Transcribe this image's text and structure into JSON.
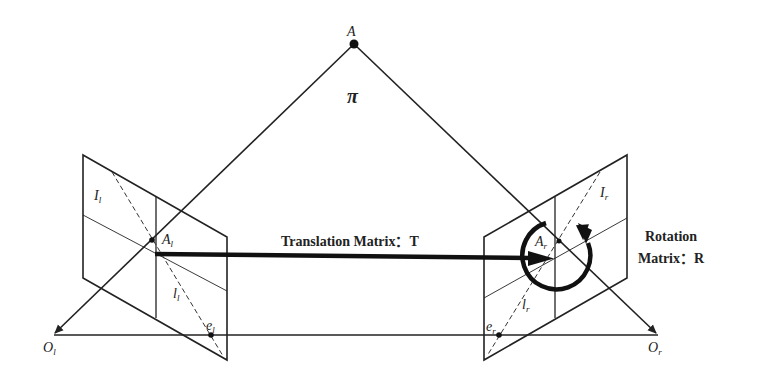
{
  "diagram": {
    "point_label": "A",
    "plane_label": "π",
    "left_camera": {
      "optical_center": "O_l",
      "optical_center_main": "O",
      "optical_center_sub": "l",
      "image_label_main": "I",
      "image_label_sub": "l",
      "projection_main": "A",
      "projection_sub": "l",
      "epipolar_main": "l",
      "epipolar_sub": "l",
      "epipole_main": "e",
      "epipole_sub": "l"
    },
    "right_camera": {
      "optical_center_main": "O",
      "optical_center_sub": "r",
      "image_label_main": "I",
      "image_label_sub": "r",
      "projection_main": "A",
      "projection_sub": "r",
      "epipolar_main": "l",
      "epipolar_sub": "r",
      "epipole_main": "e",
      "epipole_sub": "r"
    },
    "translation_label": "Translation Matrix：T",
    "rotation_label_line1": "Rotation",
    "rotation_label_line2": "Matrix：R"
  }
}
